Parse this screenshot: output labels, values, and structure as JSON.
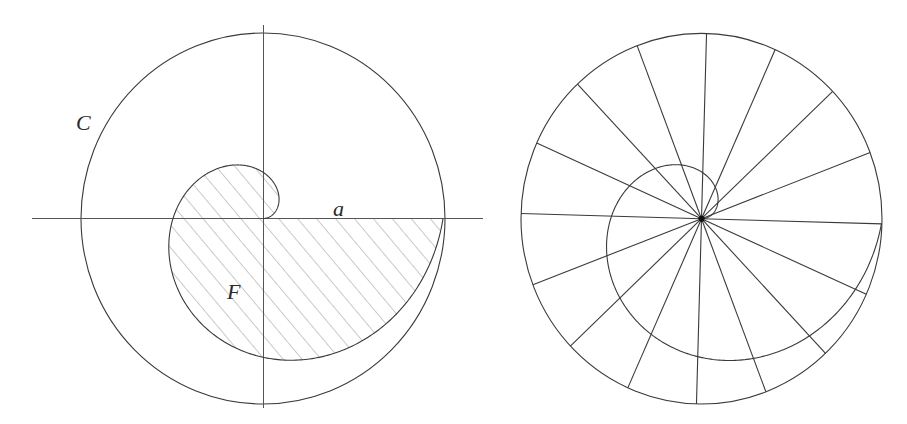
{
  "figures": {
    "left": {
      "center": [
        263,
        218.5
      ],
      "circle_radius": [
        182,
        185.5
      ],
      "spiral": {
        "rotation_deg": 0,
        "turns": 1,
        "radius_at_end": [
          180,
          185
        ]
      },
      "axes": {
        "horizontal": {
          "x1": 32,
          "x2": 483,
          "y": 218.5
        },
        "vertical": {
          "x": 263.5,
          "y1": 25,
          "y2": 408
        }
      },
      "hatch": {
        "angle_deg": 50,
        "spacing": 14.5,
        "color": "#8a8a8a"
      },
      "labels": {
        "circle": {
          "text": "C",
          "x": 76,
          "y": 130
        },
        "radius": {
          "text": "a",
          "x": 333,
          "y": 216
        },
        "area": {
          "text": "F",
          "x": 227,
          "y": 299
        }
      }
    },
    "right": {
      "center": [
        701.5,
        218.7
      ],
      "circle_radius": [
        180.5,
        185.3
      ],
      "spiral": {
        "rotation_deg": -1.6,
        "turns": 1,
        "radius_at_end": [
          180,
          184
        ]
      },
      "spokes": {
        "count": 16,
        "start_angle_deg": -1.6,
        "step_deg": 22.5
      },
      "center_dot_radius": 3
    }
  },
  "colors": {
    "line": "#3a3a3a",
    "axis": "#555555",
    "background": "#ffffff"
  }
}
